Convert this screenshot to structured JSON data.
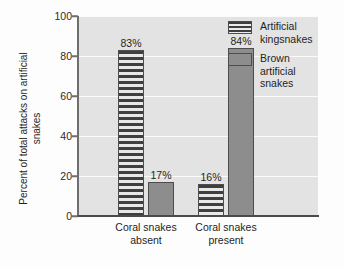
{
  "chart_data": {
    "type": "bar",
    "title": "",
    "xlabel": "",
    "ylabel": "Percent of total attacks\non artificial snakes",
    "ylim": [
      0,
      100
    ],
    "yticks": [
      0,
      20,
      40,
      60,
      80,
      100
    ],
    "ytick_labels": [
      "0",
      "20",
      "40",
      "60",
      "80",
      "100"
    ],
    "grid": true,
    "legend_position": "top-right",
    "categories": [
      "Coral snakes\nabsent",
      "Coral snakes\npresent"
    ],
    "series": [
      {
        "name": "Artificial\nkingsnakes",
        "pattern": "horizontal-stripes",
        "values": [
          83,
          16
        ],
        "value_labels": [
          "83%",
          "16%"
        ]
      },
      {
        "name": "Brown\nartificial\nsnakes",
        "pattern": "solid",
        "color": "#8d8d8d",
        "values": [
          17,
          84
        ],
        "value_labels": [
          "17%",
          "84%"
        ]
      }
    ]
  },
  "legend": {
    "items": [
      {
        "label": "Artificial\nkingsnakes",
        "swatch": "striped-swatch"
      },
      {
        "label": "Brown\nartificial\nsnakes",
        "swatch": "solid-swatch"
      }
    ]
  }
}
